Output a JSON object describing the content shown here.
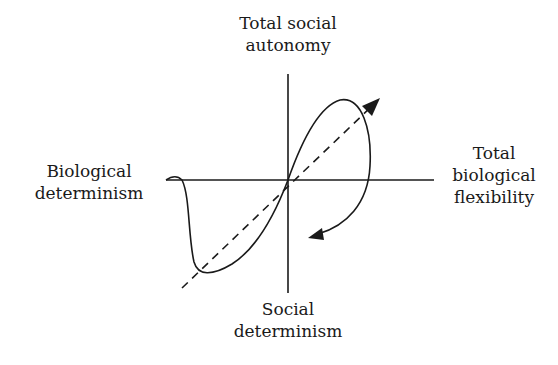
{
  "diagram": {
    "labels": {
      "top": [
        "Total social",
        "autonomy"
      ],
      "left": [
        "Biological",
        "determinism"
      ],
      "right": [
        "Total",
        "biological",
        "flexibility"
      ],
      "bottom": [
        "Social",
        "determinism"
      ]
    },
    "elements": [
      "vertical axis",
      "horizontal axis",
      "dashed diagonal arrow",
      "S-shaped curve with returning arrow"
    ],
    "stroke_color": "#1a1a1a"
  }
}
